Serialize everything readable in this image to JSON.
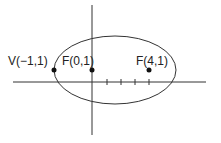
{
  "diagram": {
    "type": "ellipse-on-axes",
    "colors": {
      "stroke": "#333333",
      "background": "#ffffff",
      "text": "#222222"
    },
    "axes": {
      "x_axis": {
        "x1": 13,
        "x2": 206,
        "y": 82
      },
      "y_axis": {
        "x": 92,
        "y1": 5,
        "y2": 135
      },
      "ticks_x": [
        107,
        121,
        135,
        149
      ]
    },
    "ellipse": {
      "cx": 115,
      "cy": 70,
      "rx": 61,
      "ry": 34
    },
    "points": [
      {
        "label": "V(−1,1)",
        "x": 54,
        "y": 70,
        "label_x": 8,
        "label_y": 65
      },
      {
        "label": "F(0,1)",
        "x": 92,
        "y": 70,
        "label_x": 62,
        "label_y": 65
      },
      {
        "label": "F(4,1)",
        "x": 149,
        "y": 70,
        "label_x": 136,
        "label_y": 65
      }
    ]
  }
}
